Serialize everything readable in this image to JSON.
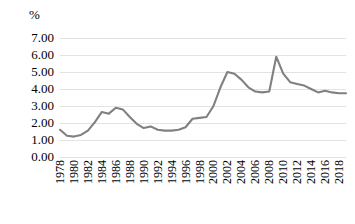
{
  "chart_data": {
    "type": "line",
    "title": "",
    "subtitle": "",
    "xlabel": "",
    "ylabel": "%",
    "unit_label": "%",
    "ylim": [
      0.0,
      7.0
    ],
    "ytick_step": 1.0,
    "ytick_labels": [
      "7.00",
      "6.00",
      "5.00",
      "4.00",
      "3.00",
      "2.00",
      "1.00",
      "0.00"
    ],
    "ytick_values": [
      7.0,
      6.0,
      5.0,
      4.0,
      3.0,
      2.0,
      1.0,
      0.0
    ],
    "xtick_labels": [
      "1978",
      "1980",
      "1982",
      "1984",
      "1986",
      "1988",
      "1990",
      "1992",
      "1994",
      "1996",
      "1998",
      "2000",
      "2002",
      "2004",
      "2006",
      "2008",
      "2010",
      "2012",
      "2014",
      "2016",
      "2018"
    ],
    "xtick_values": [
      1978,
      1980,
      1982,
      1984,
      1986,
      1988,
      1990,
      1992,
      1994,
      1996,
      1998,
      2000,
      2002,
      2004,
      2006,
      2008,
      2010,
      2012,
      2014,
      2016,
      2018
    ],
    "xlim": [
      1978,
      2019
    ],
    "grid": "horizontal",
    "legend": "none",
    "line_color": "#808080",
    "grid_color": "#E3E3E3",
    "background_color": "#FFFFFF",
    "text_color": "#000000",
    "x": [
      1978,
      1979,
      1980,
      1981,
      1982,
      1983,
      1984,
      1985,
      1986,
      1987,
      1988,
      1989,
      1990,
      1991,
      1992,
      1993,
      1994,
      1995,
      1996,
      1997,
      1998,
      1999,
      2000,
      2001,
      2002,
      2003,
      2004,
      2005,
      2006,
      2007,
      2008,
      2009,
      2010,
      2011,
      2012,
      2013,
      2014,
      2015,
      2016,
      2017,
      2018,
      2019
    ],
    "y": [
      1.6,
      1.25,
      1.2,
      1.3,
      1.55,
      2.05,
      2.65,
      2.55,
      2.9,
      2.8,
      2.35,
      1.95,
      1.7,
      1.8,
      1.6,
      1.55,
      1.55,
      1.6,
      1.75,
      2.25,
      2.3,
      2.35,
      3.0,
      4.1,
      5.0,
      4.9,
      4.55,
      4.1,
      3.85,
      3.8,
      3.85,
      5.9,
      4.9,
      4.4,
      4.3,
      4.2,
      4.0,
      3.8,
      3.9,
      3.8,
      3.75,
      3.75
    ],
    "series": [
      {
        "name": "series-1",
        "color": "#808080",
        "values": [
          1.6,
          1.25,
          1.2,
          1.3,
          1.55,
          2.05,
          2.65,
          2.55,
          2.9,
          2.8,
          2.35,
          1.95,
          1.7,
          1.8,
          1.6,
          1.55,
          1.55,
          1.6,
          1.75,
          2.25,
          2.3,
          2.35,
          3.0,
          4.1,
          5.0,
          4.9,
          4.55,
          4.1,
          3.85,
          3.8,
          3.85,
          5.9,
          4.9,
          4.4,
          4.3,
          4.2,
          4.0,
          3.8,
          3.9,
          3.8,
          3.75,
          3.75
        ]
      }
    ],
    "annotations": []
  }
}
